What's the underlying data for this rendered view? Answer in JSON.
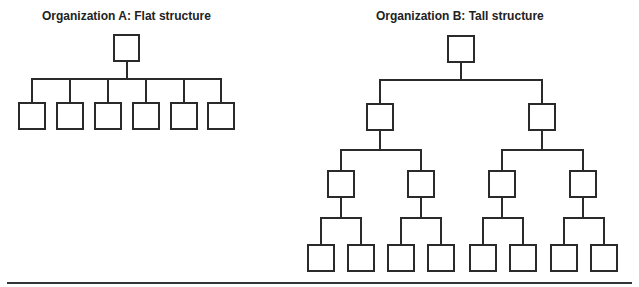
{
  "diagrams": [
    {
      "title": "Organization A: Flat structure",
      "levels": 2,
      "nodes_per_level": [
        1,
        6
      ],
      "structure": "flat"
    },
    {
      "title": "Organization B: Tall structure",
      "levels": 4,
      "nodes_per_level": [
        1,
        2,
        4,
        8
      ],
      "structure": "tall"
    }
  ],
  "colors": {
    "line": "#2a2a2a",
    "text": "#222222",
    "background": "#ffffff"
  }
}
